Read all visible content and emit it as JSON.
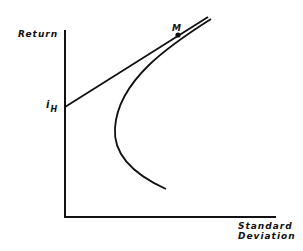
{
  "diagram": {
    "type": "efficient-frontier-with-capital-market-line",
    "y_axis_label": "Return",
    "x_axis_label_line1": "Standard",
    "x_axis_label_line2": "Deviation",
    "intercept_label": "i",
    "intercept_subscript": "H",
    "tangent_point_label": "M",
    "line_color": "#111111",
    "background": "#ffffff",
    "elements": [
      {
        "name": "y-axis",
        "from": [
          65,
          30
        ],
        "to": [
          65,
          217
        ]
      },
      {
        "name": "x-axis",
        "from": [
          64,
          217
        ],
        "to": [
          276,
          217
        ]
      },
      {
        "name": "tangent-line",
        "from": [
          65,
          107
        ],
        "to": [
          208,
          17
        ]
      },
      {
        "name": "frontier-curve",
        "upper_end": [
          211,
          19
        ],
        "vertex": [
          115,
          130
        ],
        "lower_end": [
          166,
          189
        ]
      },
      {
        "name": "tangent-point-M",
        "at": [
          178,
          35
        ]
      }
    ]
  }
}
